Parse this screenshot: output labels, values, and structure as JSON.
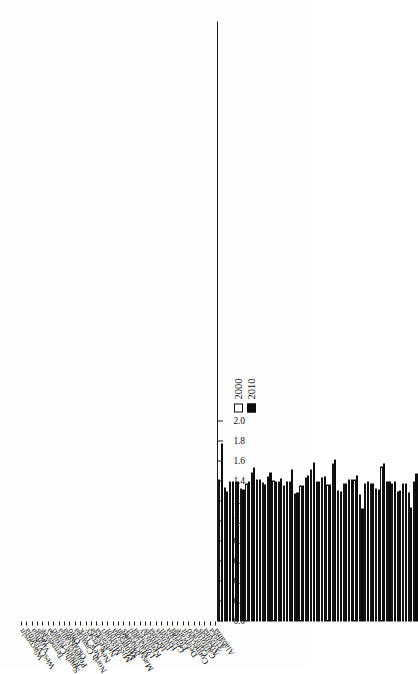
{
  "chart_data": {
    "type": "bar",
    "orientation": "horizontal",
    "title": "",
    "subtitle": "",
    "xlabel": "",
    "ylabel": "",
    "grid": false,
    "legend_position": "upper-left-inside",
    "axis_ticks": [
      "0.0",
      "0.2",
      "0.4",
      "0.6",
      "0.8",
      "1.0",
      "1.2",
      "1.4",
      "1.6",
      "1.8",
      "2.0"
    ],
    "ylim": [
      0.0,
      2.0
    ],
    "categories": [
      "Alabama",
      "Alaska",
      "Arizona",
      "Arkansas",
      "California",
      "Colorado",
      "Connecticut",
      "Delaware",
      "Florida",
      "Georgia",
      "Hawaii",
      "Illinois",
      "Indiana",
      "Kansas",
      "Kentucky",
      "Louisiana",
      "Maryland",
      "Massachusetts",
      "Michigan",
      "Minnesota",
      "Mississippi",
      "Missouri",
      "Nebraska",
      "Nevada",
      "New Jersey",
      "New York",
      "North Carolina",
      "Ohio",
      "Oklahoma",
      "Pennsylvania",
      "Rhode Island",
      "South Carolina",
      "Tennessee",
      "Texas",
      "Virginia",
      "West Virginia",
      "Wisconsin"
    ],
    "series": [
      {
        "name": "2000",
        "values": [
          1.4,
          1.29,
          1.38,
          1.3,
          1.38,
          1.4,
          1.55,
          1.33,
          1.38,
          1.38,
          1.27,
          1.42,
          1.42,
          1.38,
          1.31,
          1.58,
          1.37,
          1.44,
          1.4,
          1.52,
          1.44,
          1.36,
          1.28,
          1.4,
          1.36,
          1.4,
          1.41,
          1.45,
          1.39,
          1.42,
          1.49,
          1.38,
          1.33,
          1.4,
          1.4,
          1.34,
          1.42
        ]
      },
      {
        "name": "2010",
        "values": [
          1.48,
          1.14,
          1.38,
          1.31,
          1.4,
          1.4,
          1.58,
          1.32,
          1.38,
          1.4,
          1.13,
          1.46,
          1.42,
          1.38,
          1.3,
          1.62,
          1.37,
          1.45,
          1.4,
          1.59,
          1.46,
          1.36,
          1.29,
          1.52,
          1.4,
          1.43,
          1.4,
          1.49,
          1.37,
          1.42,
          1.54,
          1.4,
          1.32,
          1.4,
          1.4,
          1.3,
          1.78
        ]
      }
    ]
  },
  "legend": {
    "items": [
      {
        "label": "2000",
        "color": "#ffffff"
      },
      {
        "label": "2010",
        "color": "#0d0d0d"
      }
    ]
  }
}
